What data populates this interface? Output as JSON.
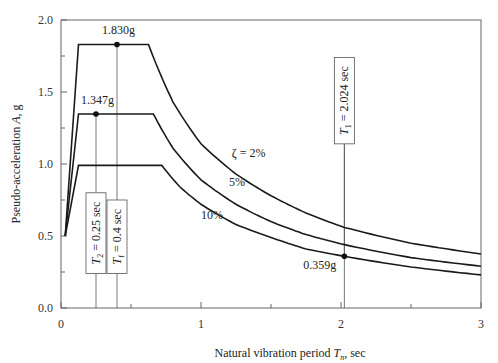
{
  "chart_data": {
    "type": "line",
    "title": "",
    "xlabel": "Natural vibration period T_n, sec",
    "xlabel_parts": {
      "pre": "Natural vibration period ",
      "var": "T",
      "sub": "n",
      "post": ", sec"
    },
    "ylabel": "Pseudo-acceleration A, g",
    "ylabel_parts": {
      "pre": "Pseudo-acceleration ",
      "var": "A",
      "post": ", g"
    },
    "xlim": [
      0,
      3
    ],
    "ylim": [
      0,
      2.0
    ],
    "x_ticks": [
      0,
      1,
      2,
      3
    ],
    "x_tick_labels": [
      "0",
      "1",
      "2",
      "3"
    ],
    "x_minor_ticks": [
      0.5,
      1.5,
      2.5
    ],
    "y_ticks": [
      0.0,
      0.5,
      1.0,
      1.5,
      2.0
    ],
    "y_tick_labels": [
      "0.0",
      "0.5",
      "1.0",
      "1.5",
      "2.0"
    ],
    "y_minor_ticks": [
      0.25,
      0.75,
      1.25,
      1.75
    ],
    "grid": false,
    "series": [
      {
        "name": "ζ = 2%",
        "label": "ζ = 2%",
        "x": [
          0.03,
          0.125,
          0.625,
          0.8,
          1.0,
          1.25,
          1.5,
          1.75,
          2.024,
          2.5,
          3.0
        ],
        "values": [
          0.5,
          1.83,
          1.83,
          1.43,
          1.14,
          0.93,
          0.78,
          0.66,
          0.56,
          0.45,
          0.375
        ]
      },
      {
        "name": "ζ = 5%",
        "label": "5%",
        "x": [
          0.03,
          0.125,
          0.66,
          0.8,
          1.0,
          1.25,
          1.5,
          1.75,
          2.024,
          2.5,
          3.0
        ],
        "values": [
          0.5,
          1.347,
          1.347,
          1.11,
          0.89,
          0.72,
          0.6,
          0.51,
          0.44,
          0.35,
          0.29
        ]
      },
      {
        "name": "ζ = 10%",
        "label": "10%",
        "x": [
          0.03,
          0.125,
          0.72,
          0.85,
          1.0,
          1.25,
          1.5,
          1.75,
          2.024,
          2.5,
          3.0
        ],
        "values": [
          0.5,
          0.99,
          0.99,
          0.84,
          0.72,
          0.58,
          0.49,
          0.41,
          0.359,
          0.285,
          0.23
        ]
      }
    ],
    "series_label_pos": [
      {
        "x": 1.22,
        "y": 1.05
      },
      {
        "x": 1.2,
        "y": 0.85
      },
      {
        "x": 1.0,
        "y": 0.62
      }
    ],
    "annotations": [
      {
        "type": "point",
        "x": 0.4,
        "y": 1.83,
        "label": "1.830g",
        "label_x": 0.41,
        "label_y": 1.9
      },
      {
        "type": "point",
        "x": 0.25,
        "y": 1.347,
        "label": "1.347g",
        "label_x": 0.26,
        "label_y": 1.415
      },
      {
        "type": "point",
        "x": 2.024,
        "y": 0.359,
        "label": "0.359g",
        "label_x": 1.73,
        "label_y": 0.27
      },
      {
        "type": "vline",
        "x": 0.25,
        "label_var": "T",
        "label_sub": "2",
        "label_text": " = 0.25 sec",
        "label": "T2 = 0.25 sec",
        "box_y": [
          0.24,
          0.8
        ]
      },
      {
        "type": "vline",
        "x": 0.4,
        "label_var": "T",
        "label_sub": "f",
        "label_text": " = 0.4 sec",
        "label": "Tf = 0.4 sec",
        "box_y": [
          0.24,
          0.75
        ]
      },
      {
        "type": "vline",
        "x": 2.024,
        "label_var": "T",
        "label_sub": "1",
        "label_text": " = 2.024 sec",
        "label": "T1 = 2.024 sec",
        "box_y": [
          1.14,
          1.74
        ]
      }
    ],
    "colors": {
      "curve": "#1a1a1a",
      "axis": "#666666",
      "vline": "#555555",
      "text": "#222222"
    }
  }
}
